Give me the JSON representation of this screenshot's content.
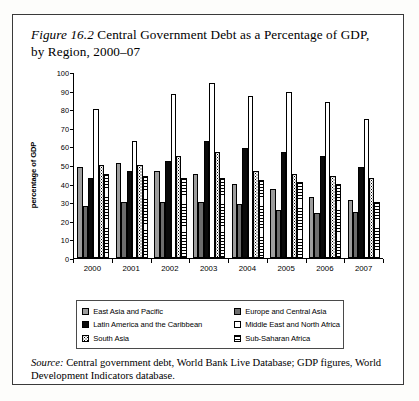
{
  "figure": {
    "label": "Figure 16.2",
    "title_rest": " Central Government Debt as a Percentage of GDP, by Region, 2000–07",
    "full_title": "Figure 16.2 Central Government Debt as a Percentage of GDP, by Region, 2000–07"
  },
  "source": {
    "label": "Source:",
    "text": " Central government debt, World Bank Live Database; GDP figures, World Development Indicators database."
  },
  "legend": {
    "items": [
      {
        "label": "East Asia and Pacific",
        "swatch": "solid-gray",
        "color": "#9d9d9d"
      },
      {
        "label": "Europe and Central Asia",
        "swatch": "solid-dark-gray",
        "color": "#6d6d6d"
      },
      {
        "label": "Latin America and the Caribbean",
        "swatch": "solid-black",
        "color": "#0a0a0a"
      },
      {
        "label": "Middle East and North Africa",
        "swatch": "empty-white",
        "color": "#ffffff"
      },
      {
        "label": "South Asia",
        "swatch": "dotted",
        "color": "#ffffff"
      },
      {
        "label": "Sub-Saharan Africa",
        "swatch": "horizontal-stripes",
        "color": "#ffffff"
      }
    ]
  },
  "chart_data": {
    "type": "bar",
    "title": "Figure 16.2 Central Government Debt as a Percentage of GDP, by Region, 2000–07",
    "xlabel": "",
    "ylabel": "percentage of GDP",
    "ylim": [
      0,
      100
    ],
    "ytick_step": 10,
    "yticks": [
      0,
      10,
      20,
      30,
      40,
      50,
      60,
      70,
      80,
      90,
      100
    ],
    "categories": [
      "2000",
      "2001",
      "2002",
      "2003",
      "2004",
      "2005",
      "2006",
      "2007"
    ],
    "grid": false,
    "legend_position": "below-plot",
    "series": [
      {
        "name": "East Asia and Pacific",
        "key": "eap",
        "values": [
          49,
          51,
          47,
          45,
          40,
          37,
          33,
          31
        ]
      },
      {
        "name": "Europe and Central Asia",
        "key": "eca",
        "values": [
          28,
          30,
          30,
          30,
          29,
          26,
          24,
          25
        ]
      },
      {
        "name": "Latin America and the Caribbean",
        "key": "lac",
        "values": [
          43,
          47,
          52,
          63,
          59,
          57,
          55,
          49
        ]
      },
      {
        "name": "Middle East and North Africa",
        "key": "mena",
        "values": [
          80,
          63,
          88,
          94,
          87,
          89,
          84,
          75
        ]
      },
      {
        "name": "South Asia",
        "key": "sa",
        "values": [
          50,
          50,
          55,
          57,
          47,
          45,
          44,
          43
        ]
      },
      {
        "name": "Sub-Saharan Africa",
        "key": "ssa",
        "values": [
          45,
          44,
          43,
          43,
          42,
          41,
          40,
          30
        ]
      }
    ]
  }
}
